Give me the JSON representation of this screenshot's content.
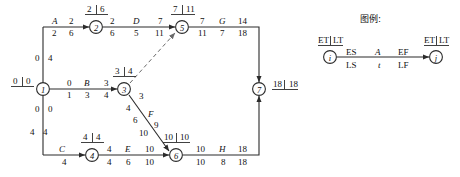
{
  "diagram": {
    "kind": "cpm-network-diagram",
    "nodes": [
      {
        "id": "1",
        "label": "1",
        "ET": "0",
        "LT": "0",
        "x": 43,
        "y": 89
      },
      {
        "id": "2",
        "label": "2",
        "ET": "2",
        "LT": "6",
        "x": 96,
        "y": 27
      },
      {
        "id": "3",
        "label": "3",
        "ET": "3",
        "LT": "4",
        "x": 124,
        "y": 89
      },
      {
        "id": "4",
        "label": "4",
        "ET": "4",
        "LT": "4",
        "x": 92,
        "y": 155
      },
      {
        "id": "5",
        "label": "5",
        "ET": "7",
        "LT": "11",
        "x": 182,
        "y": 27
      },
      {
        "id": "6",
        "label": "6",
        "ET": "10",
        "LT": "10",
        "x": 176,
        "y": 155
      },
      {
        "id": "7",
        "label": "7",
        "ET": "18",
        "LT": "18",
        "x": 259,
        "y": 89
      }
    ],
    "activities": [
      {
        "name": "A",
        "from": "1",
        "to": "2",
        "ES": "0",
        "LS": "2",
        "duration": "2",
        "EF": "2",
        "LF": "6"
      },
      {
        "name": "B",
        "from": "1",
        "to": "3",
        "ES": "0",
        "LS": "1",
        "duration": "3",
        "EF": "3",
        "LF": "4"
      },
      {
        "name": "C",
        "from": "1",
        "to": "4",
        "ES": "0",
        "LS": "0",
        "duration": "4",
        "EF": "4",
        "LF": "4"
      },
      {
        "name": "D",
        "from": "2",
        "to": "5",
        "ES": "2",
        "LS": "6",
        "duration": "5",
        "EF": "7",
        "LF": "11"
      },
      {
        "name": "E",
        "from": "4",
        "to": "6",
        "ES": "4",
        "LS": "4",
        "duration": "6",
        "EF": "10",
        "LF": "10"
      },
      {
        "name": "F",
        "from": "3",
        "to": "6",
        "ES": "3",
        "LS": "4",
        "duration": "6",
        "EF": "9",
        "LF": "10"
      },
      {
        "name": "G",
        "from": "5",
        "to": "7",
        "ES": "7",
        "LS": "11",
        "duration": "7",
        "EF": "14",
        "LF": "18"
      },
      {
        "name": "H",
        "from": "6",
        "to": "7",
        "ES": "10",
        "LS": "10",
        "duration": "8",
        "EF": "18",
        "LF": "18"
      },
      {
        "name": "dummy",
        "from": "3",
        "to": "5",
        "style": "dashed"
      }
    ],
    "labels": {
      "start_node_ET": "0",
      "start_node_LT": "0",
      "vertical_up_ES": "0",
      "vertical_up_LS": "4",
      "vertical_down_ES_top": "0",
      "vertical_down_LS_top": "0",
      "vertical_down_ES_bot": "4",
      "vertical_down_LS_bot": "4",
      "node2_ET": "2",
      "node2_LT": "6",
      "node3_ET": "3",
      "node3_LT": "4",
      "node4_ET": "4",
      "node4_LT": "4",
      "node5_ET": "7",
      "node5_LT": "11",
      "node6_ET": "10",
      "node6_LT": "10",
      "node7_ET": "18",
      "node7_LT": "18",
      "A_name": "A",
      "A_ES": "0",
      "A_EF": "2",
      "A_LS": "2",
      "A_t": "2",
      "A_LF": "6",
      "B_name": "B",
      "B_ES": "0",
      "B_EF": "3",
      "B_LS": "1",
      "B_t": "3",
      "B_LF": "4",
      "C_name": "C",
      "C_t": "4",
      "D_name": "D",
      "D_ES": "2",
      "D_EF": "7",
      "D_LS": "6",
      "D_t": "5",
      "D_LF": "11",
      "E_name": "E",
      "E_ES": "4",
      "E_EF": "10",
      "E_LS": "4",
      "E_t": "6",
      "E_LF": "10",
      "F_name": "F",
      "F_ES": "3",
      "F_LS": "4",
      "F_t": "6",
      "F_EF": "9",
      "F_LF": "10",
      "G_name": "G",
      "G_ES": "7",
      "G_EF": "14",
      "G_LS": "11",
      "G_t": "7",
      "G_LF": "18",
      "H_name": "H",
      "H_ES": "10",
      "H_EF": "18",
      "H_LS": "10",
      "H_t": "8",
      "H_LF": "18"
    }
  },
  "legend": {
    "title": "图例:",
    "node_i": "i",
    "node_j": "j",
    "node_i_ET": "ET",
    "node_i_LT": "LT",
    "node_j_ET": "ET",
    "node_j_LT": "LT",
    "above_left": "ES",
    "above_mid": "A",
    "above_right": "EF",
    "below_left": "LS",
    "below_mid": "t",
    "below_right": "LF"
  },
  "colors": {
    "line": "#2b2b2b",
    "text": "#111111",
    "background": "#ffffff"
  }
}
